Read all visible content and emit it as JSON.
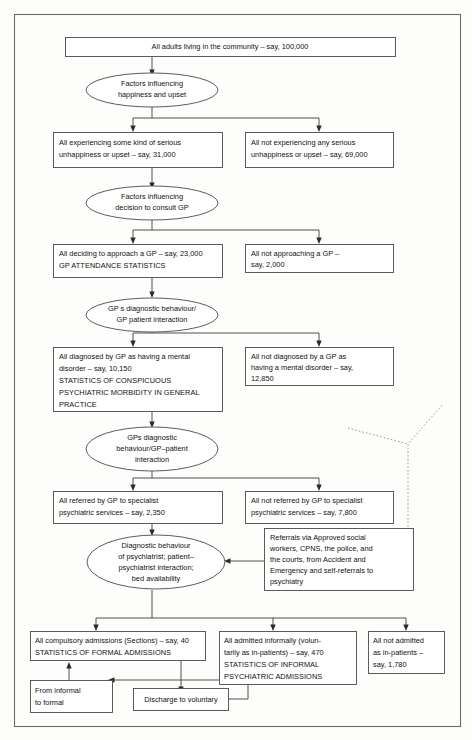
{
  "diagram": {
    "type": "flowchart",
    "nodes": {
      "all_adults": {
        "shape": "rectangle",
        "lines": [
          "All adults living in the community – say, 100,000"
        ]
      },
      "factors_happiness": {
        "shape": "ellipse",
        "lines": [
          "Factors influencing",
          "happiness and upset"
        ]
      },
      "experiencing_unhappiness": {
        "shape": "rectangle",
        "lines": [
          "All experiencing some kind of serious",
          "unhappiness or upset – say, 31,000"
        ]
      },
      "not_experiencing_unhappiness": {
        "shape": "rectangle",
        "lines": [
          "All not experiencing any serious",
          "unhappiness or upset – say, 69,000"
        ]
      },
      "factors_consult_gp": {
        "shape": "ellipse",
        "lines": [
          "Factors influencing",
          "decision to consult GP"
        ]
      },
      "approach_gp": {
        "shape": "rectangle",
        "lines": [
          "All deciding to approach a GP – say, 23,000",
          "GP ATTENDANCE STATISTICS"
        ]
      },
      "not_approach_gp": {
        "shape": "rectangle",
        "lines": [
          "All not approaching a GP –",
          "say, 2,000"
        ]
      },
      "gp_diagnostic_behaviour": {
        "shape": "ellipse",
        "lines": [
          "GP s diagnostic behaviour/",
          "GP patient interaction"
        ]
      },
      "diagnosed_by_gp": {
        "shape": "rectangle",
        "lines": [
          "All diagnosed by GP as having a mental",
          "disorder – say, 10,150",
          "STATISTICS OF CONSPICUOUS",
          "PSYCHIATRIC MORBIDITY IN GENERAL",
          "PRACTICE"
        ]
      },
      "not_diagnosed_by_gp": {
        "shape": "rectangle",
        "lines": [
          "All not diagnosed by a GP as",
          "having a mental disorder – say,",
          "12,850"
        ]
      },
      "gps_diagnostic_behaviour2": {
        "shape": "ellipse",
        "lines": [
          "GPs diagnostic",
          "behaviour/GP–patient",
          "interaction"
        ]
      },
      "referred_specialist": {
        "shape": "rectangle",
        "lines": [
          "All referred by GP to specialist",
          "psychiatric services – say, 2,350"
        ]
      },
      "not_referred_specialist": {
        "shape": "rectangle",
        "lines": [
          "All not referred by GP to specialist",
          "psychiatric services – say, 7,800"
        ]
      },
      "psychiatrist_behaviour": {
        "shape": "ellipse",
        "lines": [
          "Diagnostic behaviour",
          "of psychiatrist; patient–",
          "psychiatrist interaction;",
          "bed availability"
        ]
      },
      "referrals_via": {
        "shape": "rectangle",
        "lines": [
          "Referrals via Approved social",
          "workers, CPNS, the police, and",
          "the courts, from Accident and",
          "Emergency and self-referrals to",
          "psychiatry"
        ]
      },
      "compulsory_admissions": {
        "shape": "rectangle",
        "lines": [
          "All compulsory admissions (Sections) – say, 40",
          "STATISTICS OF FORMAL ADMISSIONS"
        ]
      },
      "admitted_informally": {
        "shape": "rectangle",
        "lines": [
          "All admitted informally (volun-",
          "tarily as in-patients) – say, 470",
          "STATISTICS OF INFORMAL",
          "PSYCHIATRIC ADMISSIONS"
        ]
      },
      "not_admitted": {
        "shape": "rectangle",
        "lines": [
          "All not admitted",
          "as in-patients –",
          "say, 1,780"
        ]
      },
      "informal_to_formal": {
        "shape": "rectangle",
        "lines": [
          "From informal",
          "to formal"
        ]
      },
      "discharge_to_voluntary": {
        "shape": "rectangle",
        "lines": [
          "Discharge to voluntary"
        ]
      }
    },
    "colors": {
      "box_stroke": "#4a4a4a",
      "frame_stroke": "#6b6b6b",
      "connector": "#3c3c3c",
      "dotted_connector": "#8e8e8e",
      "text": "#111111",
      "background": "#fdfdfc"
    }
  }
}
